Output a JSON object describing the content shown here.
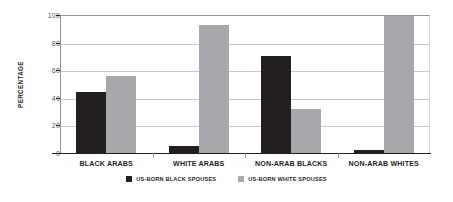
{
  "chart_data": {
    "type": "bar",
    "title": "",
    "subtitle": "",
    "xlabel": "",
    "ylabel": "PERCENTAGE",
    "ylim": [
      0,
      100
    ],
    "yticks": [
      0,
      20,
      40,
      60,
      80,
      100
    ],
    "ytick_labels": [
      "0",
      "20",
      "40",
      "60",
      "80",
      "100"
    ],
    "grid": "horizontal",
    "legend_position": "bottom-center",
    "categories": [
      "BLACK ARABS",
      "WHITE ARABS",
      "NON-ARAB BLACKS",
      "NON-ARAB WHITES"
    ],
    "series": [
      {
        "name": "US-BORN BLACK SPOUSES",
        "color": "#231f20",
        "values": [
          44,
          5,
          70,
          2
        ]
      },
      {
        "name": "US-BORN WHITE SPOUSES",
        "color": "#a6a8ab",
        "values": [
          56,
          93,
          32,
          99
        ]
      }
    ]
  },
  "legend": {
    "items": [
      {
        "label": "US-BORN BLACK SPOUSES",
        "swatch": "dark-swatch-icon"
      },
      {
        "label": "US-BORN WHITE SPOUSES",
        "swatch": "light-swatch-icon"
      }
    ]
  },
  "colors": {
    "series_dark": "#231f20",
    "series_light": "#a6a8ab",
    "gridline": "#c9cacc",
    "axis": "#231f20",
    "background": "#ffffff"
  }
}
